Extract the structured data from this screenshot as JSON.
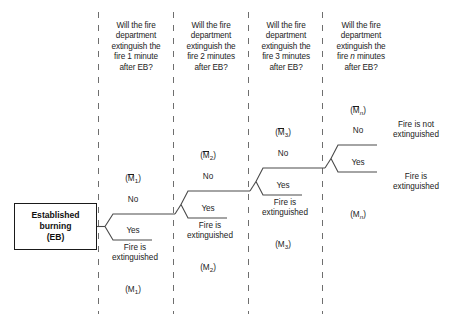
{
  "diagram": {
    "title_box": {
      "label": "Established\nburning\n(EB)",
      "name": "established-burning-box"
    },
    "stage_headers": [
      {
        "text": "Will the fire\ndepartment\nextinguish the\nfire 1 minute\nafter EB?"
      },
      {
        "text": "Will the fire\ndepartment\nextinguish the\nfire 2 minutes\nafter EB?"
      },
      {
        "text": "Will the fire\ndepartment\nextinguish the\nfire 3 minutes\nafter EB?"
      },
      {
        "text": "Will the fire\ndepartment\nextinguish the\nfire "
      }
    ],
    "stage4_header_italic": "n",
    "stage4_header_tail": " minutes\nafter EB?",
    "branches": [
      {
        "id": "stage-1",
        "no_label": "No",
        "yes_label": "Yes",
        "fail_event_base": "M",
        "fail_event_sub": "1",
        "success_event_base": "M",
        "success_event_sub": "1",
        "outcome": "Fire is\nextinguished"
      },
      {
        "id": "stage-2",
        "no_label": "No",
        "yes_label": "Yes",
        "fail_event_base": "M",
        "fail_event_sub": "2",
        "success_event_base": "M",
        "success_event_sub": "2",
        "outcome": "Fire is\nextinguished"
      },
      {
        "id": "stage-3",
        "no_label": "No",
        "yes_label": "Yes",
        "fail_event_base": "M",
        "fail_event_sub": "3",
        "success_event_base": "M",
        "success_event_sub": "3",
        "outcome": "Fire is\nextinguished"
      },
      {
        "id": "stage-n",
        "no_label": "No",
        "yes_label": "Yes",
        "fail_event_base": "M",
        "fail_event_sub": "n",
        "success_event_base": "M",
        "success_event_sub": "n",
        "outcome_no": "Fire is not\nextinguished",
        "outcome_yes": "Fire is\nextinguished"
      }
    ],
    "colors": {
      "line": "#4a4a4a",
      "box_border": "#1a1a1a",
      "text": "#1d1d1d",
      "background": "#ffffff"
    }
  }
}
